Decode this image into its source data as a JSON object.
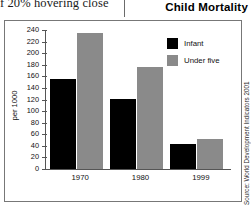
{
  "page": {
    "bleed_text": "f 20% hovering close",
    "title": "Child Mortality",
    "source_credit": "Source: World Development Indicators 2001"
  },
  "legend": {
    "items": [
      {
        "label": "Infant",
        "color": "#000000"
      },
      {
        "label": "Under five",
        "color": "#8a8a8a"
      }
    ]
  },
  "axis": {
    "y_title": "per 1000",
    "ticks": [
      {
        "label": "240",
        "value": 240
      },
      {
        "label": "220",
        "value": 220
      },
      {
        "label": "200",
        "value": 200
      },
      {
        "label": "180",
        "value": 180
      },
      {
        "label": "160",
        "value": 160
      },
      {
        "label": "140",
        "value": 140
      },
      {
        "label": "120",
        "value": 120
      },
      {
        "label": "100",
        "value": 100
      },
      {
        "label": "80",
        "value": 80
      },
      {
        "label": "60",
        "value": 60
      },
      {
        "label": "40",
        "value": 40
      },
      {
        "label": "20",
        "value": 20
      },
      {
        "label": "0",
        "value": 0
      }
    ]
  },
  "chart_data": {
    "type": "bar",
    "title": "Child Mortality",
    "xlabel": "",
    "ylabel": "per 1000",
    "ylim": [
      0,
      240
    ],
    "ytick_step": 20,
    "grid": false,
    "legend_position": "top-right",
    "categories": [
      "1970",
      "1980",
      "1999"
    ],
    "series": [
      {
        "name": "Infant",
        "color": "#000000",
        "values": [
          155,
          121,
          43
        ]
      },
      {
        "name": "Under five",
        "color": "#8a8a8a",
        "values": [
          234,
          176,
          52
        ]
      }
    ]
  }
}
